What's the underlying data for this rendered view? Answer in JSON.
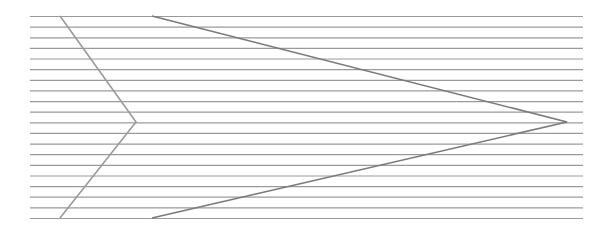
{
  "figure": {
    "width": 605,
    "height": 235,
    "colors": {
      "background": "#ffffff",
      "horizontal_lines": "#9a9a9a",
      "left_chevron": "#9a9a9a",
      "right_chevron": "#7a7a7a"
    },
    "horizontal_lines": {
      "count": 20,
      "x_start": 30,
      "x_end": 583,
      "y_start": 16,
      "y_end": 218
    },
    "shapes": [
      {
        "name": "left-chevron",
        "points": [
          [
            60,
            16
          ],
          [
            136,
            122
          ],
          [
            60,
            218
          ]
        ]
      },
      {
        "name": "right-chevron",
        "points": [
          [
            152,
            16
          ],
          [
            567,
            122
          ],
          [
            152,
            218
          ]
        ]
      }
    ]
  }
}
